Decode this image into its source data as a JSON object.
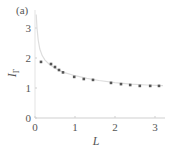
{
  "panel_label": "(a)",
  "chart_data": {
    "type": "scatter",
    "title": "",
    "panel": "(a)",
    "xlabel": "L",
    "ylabel": "I_Γ",
    "xlim": [
      0,
      3.25
    ],
    "ylim": [
      0,
      3.6
    ],
    "xticks": [
      0,
      1,
      2,
      3
    ],
    "yticks": [
      0,
      1,
      2,
      3
    ],
    "grid": false,
    "legend": null,
    "series": [
      {
        "name": "data points",
        "kind": "scatter",
        "color": "#555555",
        "x": [
          0.15,
          0.4,
          0.5,
          0.6,
          0.7,
          0.98,
          1.22,
          1.45,
          1.9,
          2.15,
          2.38,
          2.62,
          2.88,
          3.1
        ],
        "y": [
          1.87,
          1.8,
          1.7,
          1.6,
          1.52,
          1.37,
          1.3,
          1.27,
          1.17,
          1.13,
          1.1,
          1.07,
          1.07,
          1.07
        ]
      },
      {
        "name": "fit curve",
        "kind": "line",
        "color": "#dddddd",
        "x": [
          0.03,
          0.05,
          0.08,
          0.12,
          0.18,
          0.25,
          0.35,
          0.5,
          0.7,
          1.0,
          1.3,
          1.6,
          2.0,
          2.4,
          2.8,
          3.2
        ],
        "y": [
          3.45,
          3.0,
          2.6,
          2.3,
          2.08,
          1.93,
          1.8,
          1.66,
          1.53,
          1.41,
          1.32,
          1.25,
          1.18,
          1.13,
          1.1,
          1.08
        ]
      }
    ]
  }
}
